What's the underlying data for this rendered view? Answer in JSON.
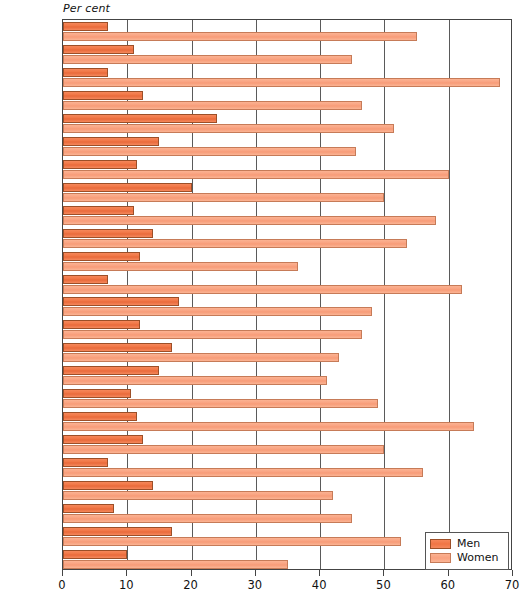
{
  "chart_data": {
    "type": "bar",
    "orientation": "horizontal",
    "title": "",
    "subtitle": "",
    "xlabel": "Per cent",
    "ylabel": "",
    "xlim": [
      0,
      70
    ],
    "xticks": [
      0,
      10,
      20,
      30,
      40,
      50,
      60,
      70
    ],
    "grid": true,
    "grid_axis": "x",
    "legend_position": "bottom-right",
    "categories": [
      "Algeria",
      "Argentina",
      "Bangladesh",
      "Brazil",
      "China",
      "Colombia",
      "Egypt",
      "India",
      "Indonesia",
      "Malaysia",
      "Mexico",
      "Morocco",
      "Nepal",
      "Pakistan",
      "Peru",
      "Philippines",
      "South Africa",
      "South Korea",
      "Sri Lanka",
      "Sudan",
      "Taiwan",
      "Tanzania",
      "Thailand",
      "Venezuela"
    ],
    "series": [
      {
        "name": "Men",
        "color": "#f07544",
        "values": [
          7,
          11,
          7,
          12.5,
          24,
          15,
          11.5,
          20,
          11,
          14,
          12,
          7,
          18,
          12,
          17,
          15,
          10.5,
          11.5,
          12.5,
          7,
          14,
          8,
          17,
          10
        ]
      },
      {
        "name": "Women",
        "color": "#f9a280",
        "values": [
          55,
          45,
          68,
          46.5,
          51.5,
          45.5,
          60,
          50,
          58,
          53.5,
          36.5,
          62,
          48,
          46.5,
          43,
          41,
          49,
          64,
          50,
          56,
          42,
          45,
          52.5,
          35
        ]
      }
    ]
  },
  "legend": {
    "items": [
      {
        "label": "Men",
        "color": "#f07544"
      },
      {
        "label": "Women",
        "color": "#f9a280"
      }
    ]
  },
  "axis": {
    "caption": "Per cent"
  }
}
